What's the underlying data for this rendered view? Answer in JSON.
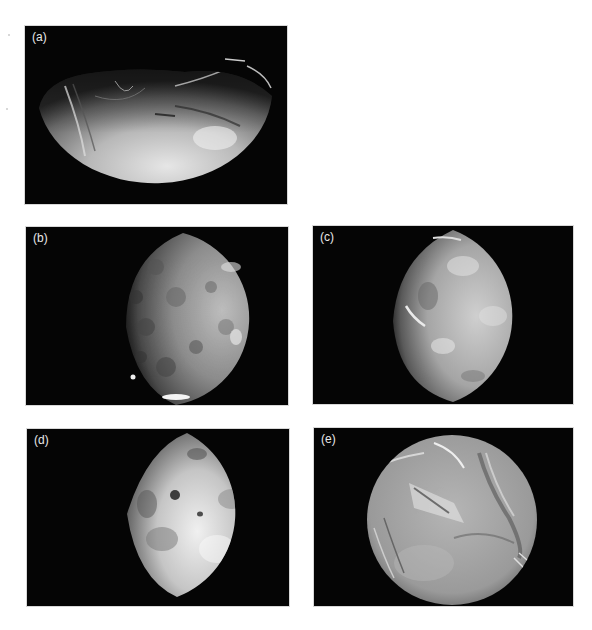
{
  "figure": {
    "panels": [
      {
        "id": "a",
        "label": "(a)",
        "subject": "half-lit-moon-grooved-surface"
      },
      {
        "id": "b",
        "label": "(b)",
        "subject": "gibbous-moon-cratered-surface"
      },
      {
        "id": "c",
        "label": "(c)",
        "subject": "gibbous-moon-bright-mottled-surface"
      },
      {
        "id": "d",
        "label": "(d)",
        "subject": "gibbous-moon-dark-spots"
      },
      {
        "id": "e",
        "label": "(e)",
        "subject": "full-moon-patchwork-terrain"
      }
    ],
    "colors": {
      "background": "#ffffff",
      "space": "#050505",
      "moon_light": "#d9d9d9",
      "moon_mid": "#9a9a9a",
      "moon_dark": "#3a3a3a"
    }
  }
}
